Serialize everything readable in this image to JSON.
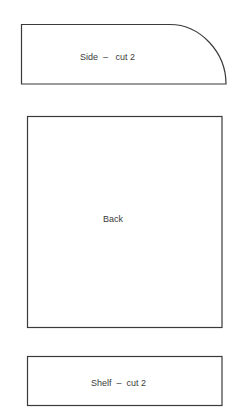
{
  "diagram": {
    "pieces": [
      {
        "id": "side",
        "label": "Side  –   cut 2",
        "shape": "rectangle-with-rounded-corner"
      },
      {
        "id": "back",
        "label": "Back",
        "shape": "rectangle"
      },
      {
        "id": "shelf",
        "label": "Shelf  –  cut 2",
        "shape": "rectangle"
      }
    ]
  }
}
